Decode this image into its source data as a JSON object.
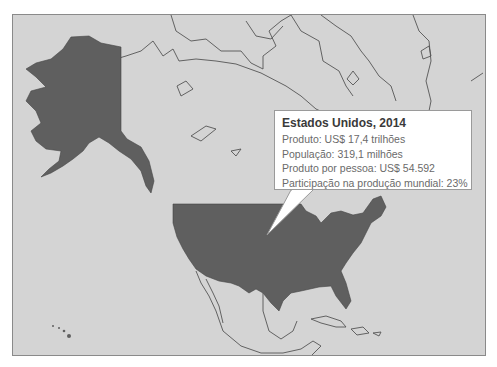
{
  "map": {
    "region": "North America",
    "colors": {
      "ocean_and_other_land": "#d4d4d4",
      "highlighted_country": "#5f5f5f",
      "borders": "#555555",
      "callout_bg": "#ffffff"
    },
    "highlighted": "Estados Unidos"
  },
  "callout": {
    "title": "Estados Unidos, 2014",
    "lines": [
      "Produto: US$ 17,4 trilhões",
      "População: 319,1 milhões",
      "Produto por pessoa: US$ 54.592",
      "Participação na produção mundial: 23%"
    ]
  }
}
